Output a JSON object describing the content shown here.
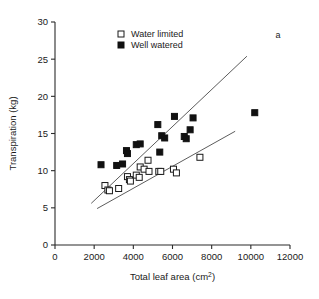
{
  "figure": {
    "panel_label": "a",
    "top_cropped_text": ""
  },
  "chart_data": {
    "type": "scatter",
    "title": "",
    "xlabel": "Total leaf area (cm2)",
    "xlabel_base": "Total leaf area (cm",
    "xlabel_sup": "2",
    "xlabel_tail": ")",
    "ylabel": "Transpiration (kg)",
    "xlim": [
      0,
      12000
    ],
    "ylim": [
      0,
      30
    ],
    "xticks": [
      0,
      2000,
      4000,
      6000,
      8000,
      10000,
      12000
    ],
    "xtick_labels": [
      "0",
      "2000",
      "4000",
      "6000",
      "8000",
      "10000",
      "12000"
    ],
    "yticks": [
      0,
      5,
      10,
      15,
      20,
      25,
      30
    ],
    "ytick_labels": [
      "0",
      "5",
      "10",
      "15",
      "20",
      "25",
      "30"
    ],
    "grid": false,
    "legend_position": "top-center",
    "marker_size_px": 6,
    "series": [
      {
        "name": "Water limited",
        "marker": "open-square",
        "color": "#ffffff",
        "edge_color": "#1a1a1a",
        "points": [
          {
            "x": 2550,
            "y": 8.0
          },
          {
            "x": 2700,
            "y": 7.4
          },
          {
            "x": 2780,
            "y": 7.3
          },
          {
            "x": 3250,
            "y": 7.6
          },
          {
            "x": 3700,
            "y": 9.2
          },
          {
            "x": 3800,
            "y": 8.8
          },
          {
            "x": 3850,
            "y": 8.6
          },
          {
            "x": 4150,
            "y": 9.4
          },
          {
            "x": 4300,
            "y": 9.1
          },
          {
            "x": 4350,
            "y": 10.5
          },
          {
            "x": 4550,
            "y": 10.2
          },
          {
            "x": 4750,
            "y": 11.4
          },
          {
            "x": 4800,
            "y": 9.9
          },
          {
            "x": 5300,
            "y": 9.9
          },
          {
            "x": 5400,
            "y": 9.9
          },
          {
            "x": 6050,
            "y": 10.2
          },
          {
            "x": 6200,
            "y": 9.7
          },
          {
            "x": 7400,
            "y": 11.8
          }
        ]
      },
      {
        "name": "Well watered",
        "marker": "filled-square",
        "color": "#111111",
        "edge_color": "#111111",
        "points": [
          {
            "x": 2350,
            "y": 10.8
          },
          {
            "x": 3150,
            "y": 10.7
          },
          {
            "x": 3450,
            "y": 10.9
          },
          {
            "x": 3650,
            "y": 12.7
          },
          {
            "x": 3700,
            "y": 12.3
          },
          {
            "x": 4150,
            "y": 13.5
          },
          {
            "x": 4350,
            "y": 13.6
          },
          {
            "x": 5250,
            "y": 16.2
          },
          {
            "x": 5350,
            "y": 12.5
          },
          {
            "x": 5450,
            "y": 14.7
          },
          {
            "x": 5600,
            "y": 14.4
          },
          {
            "x": 6100,
            "y": 17.3
          },
          {
            "x": 6600,
            "y": 14.6
          },
          {
            "x": 6700,
            "y": 14.3
          },
          {
            "x": 6900,
            "y": 15.5
          },
          {
            "x": 7050,
            "y": 17.1
          },
          {
            "x": 10200,
            "y": 17.8
          }
        ]
      }
    ],
    "fit_lines": [
      {
        "name": "well-watered-fit",
        "x1": 1850,
        "y1": 5.6,
        "x2": 9800,
        "y2": 25.4
      },
      {
        "name": "water-limited-fit",
        "x1": 2150,
        "y1": 4.9,
        "x2": 9200,
        "y2": 15.3
      }
    ]
  },
  "legend": {
    "entries": [
      {
        "label": "Water limited",
        "marker": "open-square"
      },
      {
        "label": "Well watered",
        "marker": "filled-square"
      }
    ]
  }
}
